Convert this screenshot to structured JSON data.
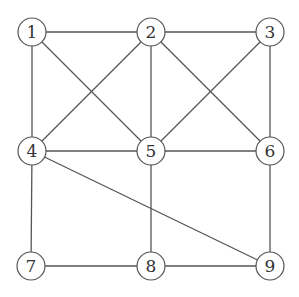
{
  "diagram": {
    "type": "undirected-graph",
    "node_radius": 14,
    "stroke_color": "#555555",
    "node_fill": "#ffffff",
    "nodes": [
      {
        "id": "1",
        "label": "1",
        "x": 32,
        "y": 32
      },
      {
        "id": "2",
        "label": "2",
        "x": 151,
        "y": 32
      },
      {
        "id": "3",
        "label": "3",
        "x": 270,
        "y": 32
      },
      {
        "id": "4",
        "label": "4",
        "x": 32,
        "y": 151
      },
      {
        "id": "5",
        "label": "5",
        "x": 151,
        "y": 151
      },
      {
        "id": "6",
        "label": "6",
        "x": 270,
        "y": 151
      },
      {
        "id": "7",
        "label": "7",
        "x": 31,
        "y": 266
      },
      {
        "id": "8",
        "label": "8",
        "x": 151,
        "y": 266
      },
      {
        "id": "9",
        "label": "9",
        "x": 270,
        "y": 266
      }
    ],
    "edges": [
      [
        "1",
        "2"
      ],
      [
        "2",
        "3"
      ],
      [
        "1",
        "4"
      ],
      [
        "1",
        "5"
      ],
      [
        "2",
        "4"
      ],
      [
        "2",
        "5"
      ],
      [
        "2",
        "6"
      ],
      [
        "3",
        "5"
      ],
      [
        "3",
        "6"
      ],
      [
        "4",
        "5"
      ],
      [
        "5",
        "6"
      ],
      [
        "4",
        "7"
      ],
      [
        "4",
        "9"
      ],
      [
        "5",
        "8"
      ],
      [
        "6",
        "9"
      ],
      [
        "7",
        "8"
      ],
      [
        "8",
        "9"
      ]
    ]
  }
}
